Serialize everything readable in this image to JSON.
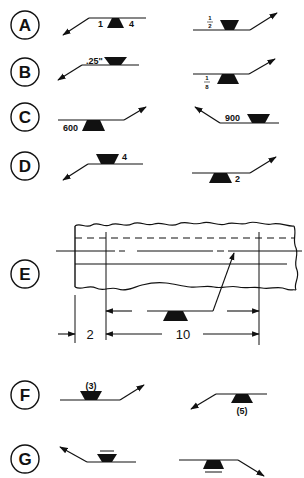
{
  "diagram": {
    "rows": [
      {
        "label": "A",
        "left": {
          "left_value": "1",
          "right_value": "4",
          "side": "arrow-side",
          "arrow_dir": "down-left"
        },
        "right": {
          "fraction_num": "1",
          "fraction_den": "2",
          "side": "other-side",
          "arrow_dir": "up-right"
        }
      },
      {
        "label": "B",
        "left": {
          "value": ".25\"",
          "side": "other-side",
          "arrow_dir": "down-left"
        },
        "right": {
          "fraction_num": "1",
          "fraction_den": "8",
          "side": "arrow-side",
          "arrow_dir": "up-right"
        }
      },
      {
        "label": "C",
        "left": {
          "value": "600",
          "side": "arrow-side",
          "arrow_dir": "up-right"
        },
        "right": {
          "value": "900",
          "side": "other-side",
          "arrow_dir": "up-left"
        }
      },
      {
        "label": "D",
        "left": {
          "value": "4",
          "side": "other-side",
          "arrow_dir": "down-left"
        },
        "right": {
          "value": "2",
          "side": "arrow-side",
          "arrow_dir": "up-right"
        }
      },
      {
        "label": "E",
        "dimensions": {
          "offset": "2",
          "length": "10"
        }
      },
      {
        "label": "F",
        "left": {
          "value": "(3)",
          "side": "other-side",
          "arrow_dir": "up-right"
        },
        "right": {
          "value": "(5)",
          "side": "arrow-side",
          "arrow_dir": "down-left"
        }
      },
      {
        "label": "G",
        "left": {
          "side": "other-side",
          "contour": "flush",
          "arrow_dir": "up-left"
        },
        "right": {
          "side": "arrow-side",
          "contour": "flush",
          "arrow_dir": "down-right"
        }
      }
    ]
  }
}
